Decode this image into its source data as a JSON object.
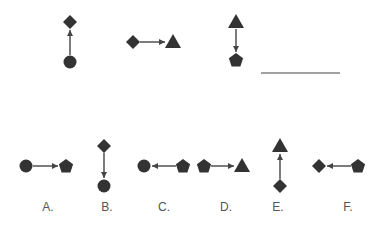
{
  "puzzle": {
    "stem": [
      {
        "id": "stem-1",
        "from": "circle",
        "to": "diamond",
        "direction": "up",
        "from_pos": [
          70,
          62
        ],
        "to_pos": [
          70,
          22
        ]
      },
      {
        "id": "stem-2",
        "from": "diamond",
        "to": "triangle",
        "direction": "right",
        "from_pos": [
          133,
          42
        ],
        "to_pos": [
          173,
          42
        ]
      },
      {
        "id": "stem-3",
        "from": "triangle",
        "to": "pentagon",
        "direction": "down",
        "from_pos": [
          236,
          22
        ],
        "to_pos": [
          236,
          60
        ]
      }
    ],
    "answer_blank": {
      "x1": 261,
      "x2": 340,
      "y": 73
    }
  },
  "options": [
    {
      "label": "A.",
      "from": "circle",
      "to": "pentagon",
      "direction": "right",
      "from_pos": [
        26,
        166
      ],
      "to_pos": [
        66,
        166
      ],
      "label_pos": [
        48,
        211
      ]
    },
    {
      "label": "B.",
      "from": "diamond",
      "to": "circle",
      "direction": "down",
      "from_pos": [
        104,
        146
      ],
      "to_pos": [
        104,
        186
      ],
      "label_pos": [
        107,
        211
      ]
    },
    {
      "label": "C.",
      "from": "pentagon",
      "to": "circle",
      "direction": "left",
      "from_pos": [
        183,
        166
      ],
      "to_pos": [
        144,
        166
      ],
      "label_pos": [
        164,
        211
      ]
    },
    {
      "label": "D.",
      "from": "pentagon",
      "to": "triangle",
      "direction": "right",
      "from_pos": [
        204,
        166
      ],
      "to_pos": [
        242,
        166
      ],
      "label_pos": [
        226,
        211
      ]
    },
    {
      "label": "E.",
      "from": "diamond",
      "to": "triangle",
      "direction": "up",
      "from_pos": [
        280,
        186
      ],
      "to_pos": [
        280,
        146
      ],
      "label_pos": [
        278,
        211
      ]
    },
    {
      "label": "F.",
      "from": "pentagon",
      "to": "diamond",
      "direction": "left",
      "from_pos": [
        358,
        166
      ],
      "to_pos": [
        319,
        166
      ],
      "label_pos": [
        348,
        211
      ]
    }
  ],
  "colors": {
    "shape": "#333333",
    "line": "#444444",
    "label": "#555555"
  }
}
